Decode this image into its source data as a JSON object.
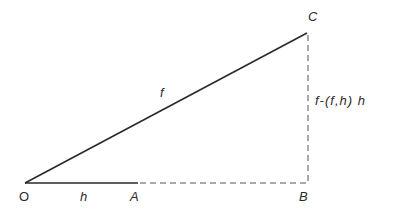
{
  "diagram": {
    "type": "geometric-projection",
    "points": {
      "O": {
        "label": "O",
        "x": 25,
        "y": 183
      },
      "A": {
        "label": "A",
        "x": 138,
        "y": 183
      },
      "B": {
        "label": "B",
        "x": 308,
        "y": 183
      },
      "C": {
        "label": "C",
        "x": 307,
        "y": 33
      }
    },
    "segments": [
      {
        "from": "O",
        "to": "C",
        "style": "solid",
        "label": "f"
      },
      {
        "from": "O",
        "to": "A",
        "style": "solid",
        "label": "h"
      },
      {
        "from": "A",
        "to": "B",
        "style": "dashed",
        "label": ""
      },
      {
        "from": "B",
        "to": "C",
        "style": "dashed",
        "label": "f-(f,h) h"
      }
    ],
    "labels": {
      "O": "O",
      "A": "A",
      "B": "B",
      "C": "C",
      "OC": "f",
      "OA": "h",
      "BC": "f-(f,h) h"
    },
    "colors": {
      "line": "#2a2a2a",
      "background": "#ffffff"
    }
  }
}
